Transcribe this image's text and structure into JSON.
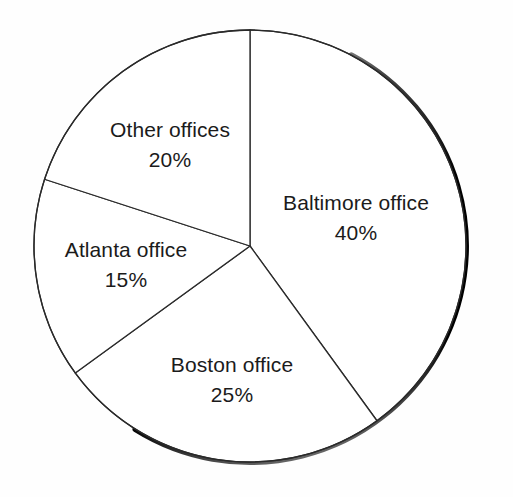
{
  "chart_data": {
    "type": "pie",
    "title": "",
    "subtitle": "",
    "xlabel": "",
    "ylabel": "",
    "legend": "none",
    "grid": false,
    "units": "percent",
    "total": 100,
    "categories": [
      "Baltimore office",
      "Boston office",
      "Atlanta office",
      "Other offices"
    ],
    "values": [
      40,
      25,
      15,
      20
    ],
    "value_labels": [
      "40%",
      "25%",
      "15%",
      "20%"
    ],
    "start_angle_deg": 0,
    "direction": "clockwise",
    "slices": [
      {
        "name": "Baltimore office",
        "value": 40,
        "value_label": "40%",
        "start_angle_deg": 0,
        "end_angle_deg": 144,
        "fill": "#ffffff",
        "stroke": "#2a2a2a",
        "label_x": 356,
        "label_y": 218
      },
      {
        "name": "Boston office",
        "value": 25,
        "value_label": "25%",
        "start_angle_deg": 144,
        "end_angle_deg": 234,
        "fill": "#ffffff",
        "stroke": "#2a2a2a",
        "label_x": 232,
        "label_y": 380
      },
      {
        "name": "Atlanta office",
        "value": 15,
        "value_label": "15%",
        "start_angle_deg": 234,
        "end_angle_deg": 288,
        "fill": "#ffffff",
        "stroke": "#2a2a2a",
        "label_x": 126,
        "label_y": 265
      },
      {
        "name": "Other offices",
        "value": 20,
        "value_label": "20%",
        "start_angle_deg": 288,
        "end_angle_deg": 360,
        "fill": "#ffffff",
        "stroke": "#2a2a2a",
        "label_x": 170,
        "label_y": 145
      }
    ],
    "geometry": {
      "center_x": 250,
      "center_y": 246,
      "radius": 216
    },
    "style": {
      "background": "#fefefe",
      "slice_fill": "#ffffff",
      "outline_color": "#2a2a2a",
      "outline_width": 1.3,
      "shadow_color": "#000000",
      "shadow_width": 6,
      "label_color": "#1b1b1b"
    }
  }
}
